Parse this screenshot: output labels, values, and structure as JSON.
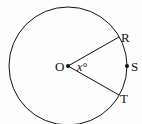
{
  "diagram": {
    "center": {
      "label": "O",
      "x": 68,
      "y": 66
    },
    "radius": 59,
    "points": [
      {
        "label": "R",
        "x": 119,
        "y": 37
      },
      {
        "label": "S",
        "x": 127,
        "y": 66
      },
      {
        "label": "T",
        "x": 119,
        "y": 95
      }
    ],
    "angle_label": "x°",
    "colors": {
      "stroke": "#111111",
      "background": "#fdfdfd"
    }
  }
}
